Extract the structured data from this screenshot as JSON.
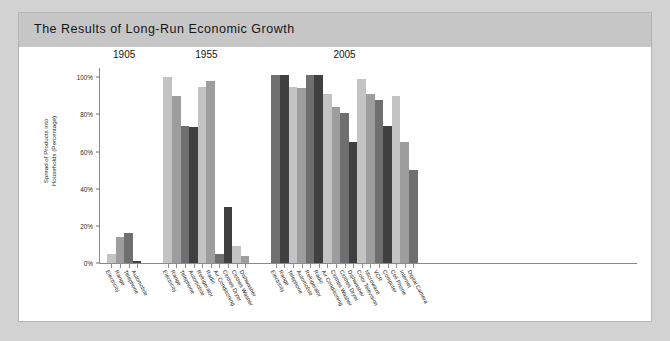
{
  "card": {
    "title": "The Results of Long-Run Economic Growth"
  },
  "chart_data": {
    "type": "bar",
    "title": "The Results of Long-Run Economic Growth",
    "xlabel": "",
    "ylabel": "Spread of Products into\nHouseholds (Percentage)",
    "ylim": [
      0,
      105
    ],
    "yticks": [
      0,
      20,
      40,
      60,
      80,
      100
    ],
    "ytick_labels": [
      "0%",
      "20%",
      "40%",
      "60%",
      "80%",
      "100%"
    ],
    "grid": false,
    "legend": "none",
    "group_titles": [
      "1905",
      "1955",
      "2005"
    ],
    "groups": [
      {
        "name": "1905",
        "categories": [
          "Electricity",
          "Range",
          "Telephone",
          "Automobile"
        ],
        "values": [
          5,
          14,
          16,
          1
        ]
      },
      {
        "name": "1955",
        "categories": [
          "Electricity",
          "Range",
          "Telephone",
          "Automobile",
          "Refrigerator",
          "Radio",
          "Air Conditioning",
          "Clothes Dryer",
          "Clothes Washer",
          "Dishwasher"
        ],
        "values": [
          100,
          90,
          74,
          73,
          95,
          98,
          5,
          30,
          9,
          4
        ]
      },
      {
        "name": "2005",
        "categories": [
          "Electricity",
          "Range",
          "Telephone",
          "Automobile",
          "Refrigerator",
          "Radio",
          "Air Conditioning",
          "Clothes Washer",
          "Clothes Dryer",
          "Dishwasher",
          "Color Television",
          "Microwave",
          "VCR",
          "Computer",
          "Cell Phone",
          "Internet",
          "Digital Camera"
        ],
        "values": [
          101,
          101,
          95,
          94,
          101,
          101,
          91,
          84,
          81,
          65,
          99,
          91,
          88,
          74,
          90,
          65,
          50
        ]
      }
    ],
    "bar_palette": [
      "#c3c3c3",
      "#9d9d9d",
      "#6f6f6f",
      "#404040"
    ],
    "axis_color": "#8a8a8a"
  },
  "colors": {
    "page_background": "#d2d2d2",
    "card_background": "#ffffff",
    "header_background": "#c6c6c6",
    "title_text": "#161616"
  }
}
